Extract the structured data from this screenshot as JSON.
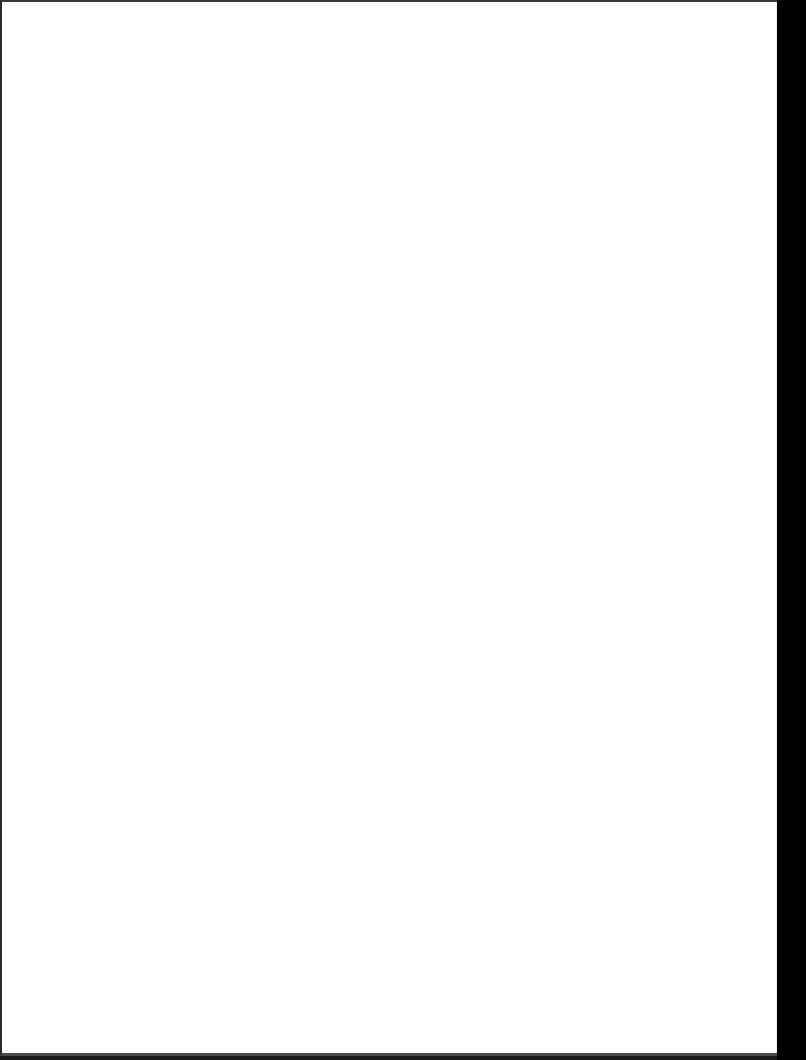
{
  "document": {
    "type": "scanned-page",
    "content": "",
    "page_color": "#ffffff",
    "background_color": "#000000"
  }
}
